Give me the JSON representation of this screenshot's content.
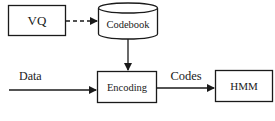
{
  "diagram": {
    "nodes": {
      "vq": {
        "label": "VQ",
        "shape": "rectangle"
      },
      "codebook": {
        "label": "Codebook",
        "shape": "cylinder"
      },
      "encoding": {
        "label": "Encoding",
        "shape": "rectangle"
      },
      "hmm": {
        "label": "HMM",
        "shape": "rectangle"
      }
    },
    "edges": {
      "vq_to_codebook": {
        "from": "VQ",
        "to": "Codebook",
        "style": "dashed",
        "label": ""
      },
      "codebook_to_encoding": {
        "from": "Codebook",
        "to": "Encoding",
        "style": "solid",
        "label": ""
      },
      "data_to_encoding": {
        "from": "",
        "to": "Encoding",
        "style": "solid",
        "label": "Data"
      },
      "encoding_to_hmm": {
        "from": "Encoding",
        "to": "HMM",
        "style": "solid",
        "label": "Codes"
      }
    },
    "colors": {
      "stroke": "#1a1a1a",
      "background": "#ffffff"
    }
  }
}
